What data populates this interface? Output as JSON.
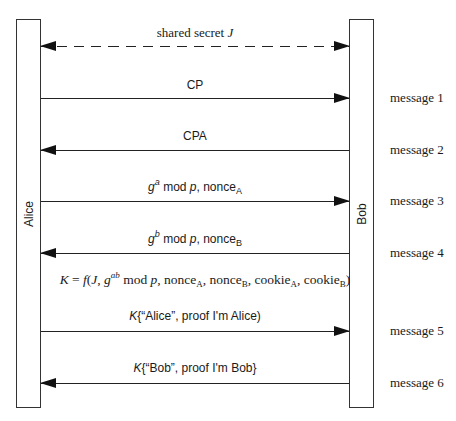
{
  "diagram": {
    "type": "sequence-diagram",
    "participants": [
      {
        "id": "alice",
        "label": "Alice"
      },
      {
        "id": "bob",
        "label": "Bob"
      }
    ],
    "shared_secret": {
      "text": "shared secret ",
      "var": "J",
      "style": "dashed",
      "direction": "both"
    },
    "messages": [
      {
        "number": "message 1",
        "label": "CP",
        "direction": "alice-to-bob"
      },
      {
        "number": "message 2",
        "label": "CPA",
        "direction": "bob-to-alice"
      },
      {
        "number": "message 3",
        "label_g": "g",
        "label_sup": "a",
        "label_mid": " mod ",
        "label_p": "p",
        "label_rest": ", nonce",
        "label_sub": "A",
        "direction": "alice-to-bob"
      },
      {
        "number": "message 4",
        "label_g": "g",
        "label_sup": "b",
        "label_mid": " mod ",
        "label_p": "p",
        "label_rest": ", nonce",
        "label_sub": "B",
        "direction": "bob-to-alice"
      },
      {
        "number": "message 5",
        "label_k": "K",
        "label_rest": "{“Alice”, proof I'm Alice)",
        "direction": "alice-to-bob"
      },
      {
        "number": "message 6",
        "label_k": "K",
        "label_rest": "{“Bob”, proof I'm Bob}",
        "direction": "bob-to-alice"
      }
    ],
    "key_formula": {
      "K": "K",
      "eq": " = ",
      "f": "f",
      "open": "(",
      "J": "J",
      "c1": ", ",
      "g": "g",
      "ab": "ab",
      "mod": " mod ",
      "p": "p",
      "nA": ", nonce",
      "A1": "A",
      "nB": ", nonce",
      "B1": "B",
      "cA": ", cookie",
      "A2": "A",
      "cB": ", cookie",
      "B2": "B",
      "close": ")",
      "full_text": "K = f(J, g^ab mod p, nonce_A, nonce_B, cookie_A, cookie_B)"
    }
  }
}
